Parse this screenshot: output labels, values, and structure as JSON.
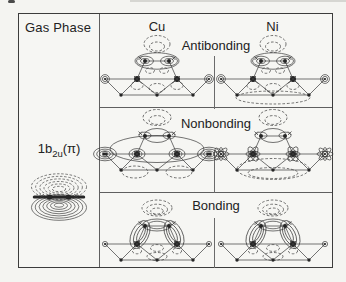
{
  "figure": {
    "gas_phase_label": "Gas Phase",
    "orbital_label": {
      "prefix": "1b",
      "sub": "2u",
      "suffix": "(π)"
    },
    "columns": [
      {
        "label": "Cu"
      },
      {
        "label": "Ni"
      }
    ],
    "rows": [
      {
        "label": "Antibonding"
      },
      {
        "label": "Nonbonding"
      },
      {
        "label": "Bonding"
      }
    ],
    "colors": {
      "line": "#3a3a3a",
      "border": "#3c3c3c",
      "divider": "#6b6b6b",
      "background": "#f4f4f1",
      "text": "#222222"
    }
  }
}
